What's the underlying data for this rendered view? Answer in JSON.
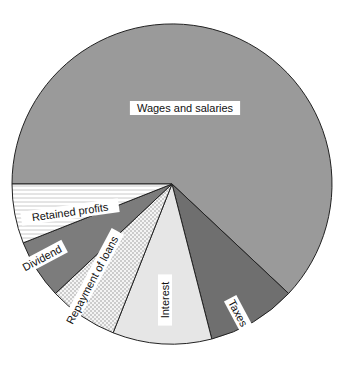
{
  "chart_data": {
    "type": "pie",
    "title": "",
    "start_angle_deg": 270,
    "direction": "clockwise",
    "slices": [
      {
        "label": "Wages and salaries",
        "value": 62,
        "fill": "#9a9a9a",
        "pattern": "solid",
        "label_rotation": 0
      },
      {
        "label": "Taxes",
        "value": 9,
        "fill": "#6f6f6f",
        "pattern": "solid",
        "label_rotation": 62
      },
      {
        "label": "Interest",
        "value": 10,
        "fill": "#e6e6e6",
        "pattern": "solid",
        "label_rotation": -90
      },
      {
        "label": "Repayment of loans",
        "value": 7,
        "fill": "#f2f2f2",
        "pattern": "dots",
        "label_rotation": -62
      },
      {
        "label": "Dividend",
        "value": 6,
        "fill": "#7c7c7c",
        "pattern": "solid",
        "label_rotation": -28
      },
      {
        "label": "Retained profits",
        "value": 6,
        "fill": "#ffffff",
        "pattern": "hlines",
        "label_rotation": -8
      }
    ],
    "legend": "none",
    "grid": false,
    "colors": {
      "outline": "#222222"
    }
  }
}
